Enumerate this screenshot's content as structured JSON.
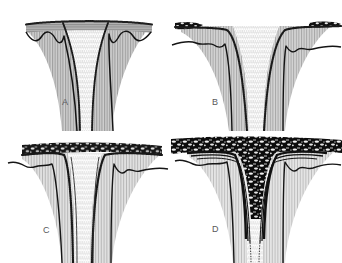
{
  "figure": {
    "panel_count": 4,
    "background_color": "#ffffff",
    "rules": [
      {
        "name": "top-rule",
        "color": "#b9b9bb"
      },
      {
        "name": "middle-rule",
        "color": "#b9b9bb"
      },
      {
        "name": "bottom-rule",
        "color": "#b9b9bb"
      }
    ],
    "panels": [
      {
        "label": "A",
        "caption": "",
        "stage": 1,
        "cap_layer": {
          "name": "upper-hatched-layer",
          "fill": "#a8a8a8",
          "texture": "horizontal-hatching",
          "continuity": "continuous",
          "deformation": "undulating-base"
        },
        "funnel": {
          "name": "central-funnel",
          "texture": "vertical-stipple",
          "fill": "#fdfdfd",
          "margin": "dark-stippled"
        },
        "flank_layers": {
          "name": "flank-layered-zone",
          "fill": "#c9c9c9",
          "texture": "vertical-hatching"
        },
        "basal_contact": {
          "name": "basal-contact-line",
          "color": "#1c1c1c",
          "shape": "scalloped"
        }
      },
      {
        "label": "B",
        "caption": "",
        "stage": 2,
        "cap_layer": {
          "name": "upper-dark-blocks",
          "fill": "#111111",
          "texture": "isolated-rafted-blocks",
          "continuity": "disrupted",
          "deformation": "down-dragged-margins"
        },
        "funnel": {
          "name": "central-funnel",
          "texture": "vertical-stipple",
          "fill": "#fdfdfd",
          "margin": "dark-stippled"
        },
        "flank_layers": {
          "name": "flank-layered-zone",
          "fill": "#cfcfcf",
          "texture": "vertical-hatching"
        },
        "basal_contact": {
          "name": "basal-contact-line",
          "color": "#1c1c1c",
          "shape": "irregular-with-kinks"
        }
      },
      {
        "label": "C",
        "caption": "",
        "stage": 3,
        "cap_layer": {
          "name": "upper-brecciated-layer",
          "fill": "#1a1a1a",
          "texture": "mottled-breccia",
          "continuity": "semi-continuous",
          "deformation": "steeply-down-dragged"
        },
        "funnel": {
          "name": "central-funnel",
          "texture": "vertical-stipple",
          "fill": "#fbfbfb",
          "margin": "dark-stippled"
        },
        "flank_layers": {
          "name": "flank-layered-zone",
          "fill": "#dadada",
          "texture": "vertical-hatching"
        },
        "basal_contact": {
          "name": "basal-contact-line",
          "color": "#1c1c1c",
          "shape": "irregular-with-steps"
        }
      },
      {
        "label": "D",
        "caption": "",
        "stage": 4,
        "cap_layer": {
          "name": "upper-brecciated-layer",
          "fill": "#0d0d0d",
          "texture": "coarse-mottled-breccia",
          "continuity": "continuous-thickened",
          "deformation": "strongly-infolded-into-funnel"
        },
        "funnel": {
          "name": "central-funnel",
          "texture": "vertical-stipple",
          "fill": "#fbfbfb",
          "margin": "dark-swirled"
        },
        "flank_layers": {
          "name": "flank-layered-zone",
          "fill": "#dedede",
          "texture": "vertical-hatching"
        },
        "basal_contact": {
          "name": "basal-contact-line",
          "color": "#1c1c1c",
          "shape": "irregular-with-hummocks"
        }
      }
    ]
  }
}
